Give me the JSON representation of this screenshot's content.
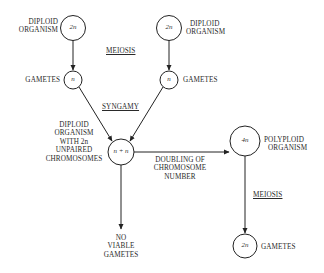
{
  "diagram": {
    "nodes": {
      "diploid_left": {
        "symbol": "2n",
        "label_line1": "DIPLOID",
        "label_line2": "ORGANISM"
      },
      "diploid_right": {
        "symbol": "2n",
        "label_line1": "DIPLOID",
        "label_line2": "ORGANISM"
      },
      "gamete_left": {
        "symbol": "n",
        "label": "GAMETES"
      },
      "gamete_right": {
        "symbol": "n",
        "label": "GAMETES"
      },
      "zygote": {
        "symbol": "n + n",
        "label_lines": [
          "DIPLOID",
          "ORGANISM",
          "WITH 2n",
          "UNPAIRED",
          "CHROMOSOMES"
        ]
      },
      "polyploid": {
        "symbol": "4n",
        "label_line1": "POLYPLOID",
        "label_line2": "ORGANISM"
      },
      "polyploid_gametes": {
        "symbol": "2n",
        "label": "GAMETES"
      },
      "no_viable": {
        "label_lines": [
          "NO",
          "VIABLE",
          "GAMETES"
        ]
      }
    },
    "process_labels": {
      "meiosis_top": "MEIOSIS",
      "syngamy": "SYNGAMY",
      "doubling": [
        "DOUBLING OF",
        "CHROMOSOME",
        "NUMBER"
      ],
      "meiosis_right": "MEIOSIS"
    },
    "colors": {
      "line": "#222222",
      "text": "#2a2a2a",
      "background": "#ffffff"
    }
  }
}
